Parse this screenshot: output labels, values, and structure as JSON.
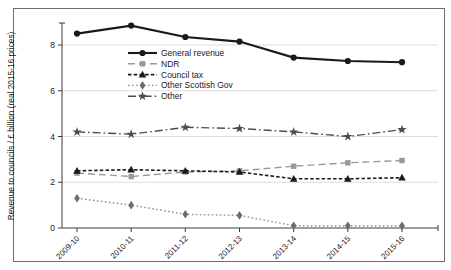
{
  "figure": {
    "background": "#ffffff",
    "border_color": "#6e6e6e",
    "axis_color": "#3a3a3a",
    "grid_color": "#d9d9d9",
    "text_color": "#1a1a1a"
  },
  "chart_data": {
    "type": "line",
    "title": "",
    "xlabel": "",
    "ylabel": "Revenue to councils / £ billion (real 2015-16 prices)",
    "ylim": [
      0,
      9
    ],
    "yticks": [
      0,
      2,
      4,
      6,
      8
    ],
    "grid": true,
    "legend_position": "upper-left-inside",
    "categories": [
      "2009-10",
      "2010-11",
      "2011-12",
      "2012-13",
      "2013-14",
      "2014-15",
      "2015-16"
    ],
    "series": [
      {
        "name": "General revenue",
        "values": [
          8.5,
          8.85,
          8.35,
          8.15,
          7.45,
          7.3,
          7.25
        ],
        "color": "#1a1a1a",
        "marker": "circle",
        "dash": "solid",
        "width": 2.1
      },
      {
        "name": "NDR",
        "values": [
          2.4,
          2.25,
          2.45,
          2.5,
          2.7,
          2.85,
          2.95
        ],
        "color": "#999999",
        "marker": "square",
        "dash": "dashed",
        "width": 1.4
      },
      {
        "name": "Council tax",
        "values": [
          2.5,
          2.55,
          2.5,
          2.45,
          2.15,
          2.15,
          2.2
        ],
        "color": "#1a1a1a",
        "marker": "triangle",
        "dash": "dense-dash",
        "width": 1.6
      },
      {
        "name": "Other Scottish Gov",
        "values": [
          1.3,
          1.0,
          0.6,
          0.55,
          0.1,
          0.1,
          0.1
        ],
        "color": "#909090",
        "marker": "diamond",
        "dash": "dotted",
        "width": 1.4,
        "marker_color": "#6e6e6e"
      },
      {
        "name": "Other",
        "values": [
          4.2,
          4.1,
          4.4,
          4.35,
          4.2,
          4.0,
          4.3
        ],
        "color": "#4d4d4d",
        "marker": "star",
        "dash": "dash-dot",
        "width": 1.4
      }
    ]
  }
}
